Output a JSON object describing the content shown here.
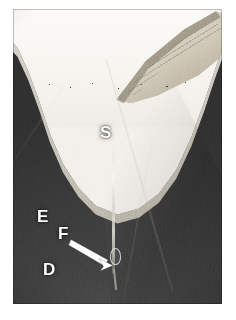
{
  "figure": {
    "kind": "micrograph",
    "modality": "grayscale light micrograph",
    "background_color": "#ffffff",
    "plate": {
      "x": 13,
      "y": 9,
      "width": 209,
      "height": 295,
      "dark_field_color": "#3a3a3a",
      "light_field_color": "#f6f4ef",
      "wedge_color": "#c9c0ad",
      "junction_line_color": "#e8e4d8"
    },
    "labels": [
      {
        "id": "S",
        "text": "S",
        "color": "#ffffff",
        "x": 100,
        "y": 124,
        "font_size": 17
      },
      {
        "id": "E",
        "text": "E",
        "color": "#ffffff",
        "x": 37,
        "y": 208,
        "font_size": 17
      },
      {
        "id": "F",
        "text": "F",
        "color": "#ffffff",
        "x": 58,
        "y": 225,
        "font_size": 17
      },
      {
        "id": "D",
        "text": "D",
        "color": "#ffffff",
        "x": 43,
        "y": 261,
        "font_size": 17
      }
    ],
    "arrow": {
      "color": "#ffffff",
      "from_x": 71,
      "from_y": 240,
      "to_x": 110,
      "to_y": 263,
      "points_to": "central fissure",
      "head_length": 13,
      "shaft_width": 3
    },
    "features": [
      {
        "name": "light-enamel-field",
        "description": "bright upper field above the occlusal contour"
      },
      {
        "name": "enamel-wedge",
        "description": "tan sectioned enamel flap at upper right"
      },
      {
        "name": "dentino-enamel-junction",
        "description": "thin bright U-shaped line across the upper dark body"
      },
      {
        "name": "central-fissure",
        "description": "thin bright vertical crack running down the middle of the dark field"
      },
      {
        "name": "cusp-slope-boundary",
        "description": "faint diagonal tonal boundary on the right half"
      }
    ]
  }
}
